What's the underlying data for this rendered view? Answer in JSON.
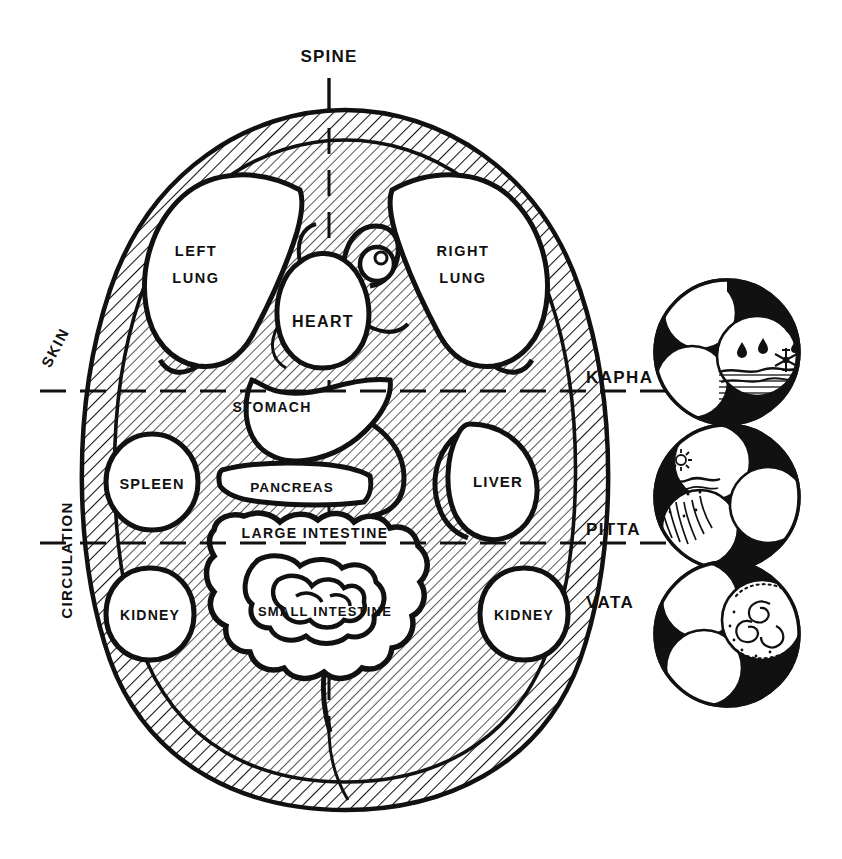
{
  "diagram": {
    "title": "SPINE",
    "type": "ayurvedic-anatomical-cross-section",
    "ink_color": "#111111",
    "background_color": "#ffffff"
  },
  "axis": {
    "spine_label": "SPINE"
  },
  "side_labels": {
    "skin": "SKIN",
    "circulation": "CIRCULATION"
  },
  "organs": [
    {
      "id": "left-lung",
      "line1": "LEFT",
      "line2": "LUNG",
      "label": "LEFT LUNG"
    },
    {
      "id": "right-lung",
      "line1": "RIGHT",
      "line2": "LUNG",
      "label": "RIGHT LUNG"
    },
    {
      "id": "heart",
      "line1": "HEART",
      "line2": "",
      "label": "HEART"
    },
    {
      "id": "stomach",
      "line1": "STOMACH",
      "line2": "",
      "label": "STOMACH"
    },
    {
      "id": "spleen",
      "line1": "SPLEEN",
      "line2": "",
      "label": "SPLEEN"
    },
    {
      "id": "pancreas",
      "line1": "PANCREAS",
      "line2": "",
      "label": "PANCREAS"
    },
    {
      "id": "liver",
      "line1": "LIVER",
      "line2": "",
      "label": "LIVER"
    },
    {
      "id": "large-intestine",
      "line1": "LARGE  INTESTINE",
      "line2": "",
      "label": "LARGE INTESTINE"
    },
    {
      "id": "small-intestine",
      "line1": "SMALL  INTESTINE",
      "line2": "",
      "label": "SMALL INTESTINE"
    },
    {
      "id": "kidney-left",
      "line1": "KIDNEY",
      "line2": "",
      "label": "KIDNEY"
    },
    {
      "id": "kidney-right",
      "line1": "KIDNEY",
      "line2": "",
      "label": "KIDNEY"
    }
  ],
  "doshas": [
    {
      "id": "kapha",
      "label": "KAPHA",
      "symbol": "triskelion-water-icon",
      "elements": "water, waves, raindrops, snowflake",
      "divider": "dashed"
    },
    {
      "id": "pitta",
      "label": "PITTA",
      "symbol": "triskelion-fire-icon",
      "elements": "sun, desert, fire",
      "divider": "dashed"
    },
    {
      "id": "vata",
      "label": "VATA",
      "symbol": "triskelion-air-icon",
      "elements": "wind, spiral, air",
      "divider": "none"
    }
  ]
}
